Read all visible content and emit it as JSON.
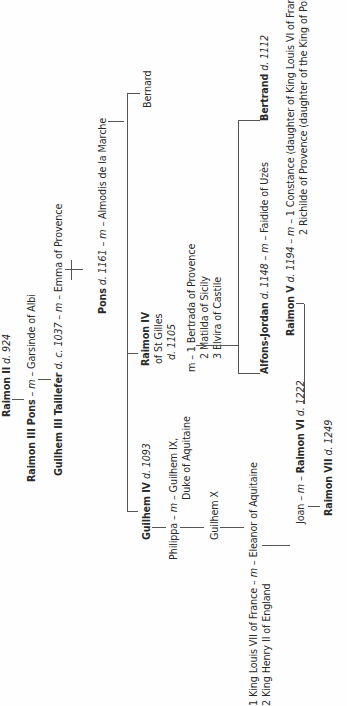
{
  "diagram": {
    "type": "family-tree",
    "orientation": "rotated-90-ccw"
  },
  "people": {
    "raimon2": {
      "name": "Raimon II",
      "note": "d. 924"
    },
    "raimon3": {
      "name": "Raimon III Pons",
      "m": "– m –",
      "spouse": "Garsinde of Albi"
    },
    "guilhem3": {
      "name": "Guilhem III Taillefer",
      "note": "d. c. 1037",
      "m": "– m –",
      "spouse": "Emma of Provence"
    },
    "pons": {
      "name": "Pons",
      "note": "d. 1161",
      "m": "– m –",
      "spouse": "Almodis de la Marche"
    },
    "bernard": {
      "name": "Bernard"
    },
    "raimon4": {
      "name": "Raimon IV",
      "line2": "of St Gilles",
      "note": "d. 1105"
    },
    "raimon4_spouses": {
      "m": "m – ",
      "s1": "1 Bertrada of Provence",
      "s2": "2 Matilda of Sicily",
      "s3": "3 Elvira of Castile"
    },
    "guilhem4": {
      "name": "Guilhem IV",
      "note": "d. 1093"
    },
    "philippa": {
      "name": "Philippa",
      "m": " – m – ",
      "spouse": "Guilhem IX,",
      "spouse_line2": "Duke of Aquitaine"
    },
    "guilhem10": {
      "name": "Guilhem X"
    },
    "eleanor": {
      "s1": "1 King Louis VII of France",
      "m": " – m – ",
      "name": "Eleanor of Aquitaine",
      "s2": "2 King Henry II of England"
    },
    "alfons": {
      "name": "Alfons-Jordan",
      "note": "d. 1148",
      "m": " – m – ",
      "spouse": "Faidide of Uzès"
    },
    "bertrand": {
      "name": "Bertrand",
      "note": "d. 1112"
    },
    "raimon5": {
      "name": "Raimon V",
      "note": "d. 1194",
      "m": " – m – ",
      "s1": "1 Constance (daughter of King Louis VI of France)",
      "s2": "2 Richilde of Provence (daughter of the King of Poland)"
    },
    "raimon6": {
      "spouse": "Joan",
      "m": " – m – ",
      "name": "Raimon VI",
      "note": "d. 1222"
    },
    "raimon7": {
      "name": "Raimon VII",
      "note": "d. 1249"
    }
  },
  "colors": {
    "text": "#2a2a2a",
    "lines": "#555555",
    "background": "#fefefe"
  }
}
